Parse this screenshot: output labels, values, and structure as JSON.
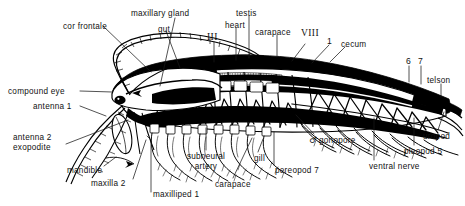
{
  "figure": {
    "width": 465,
    "height": 206,
    "background": "#ffffff",
    "ink": "#000000"
  },
  "labels": [
    {
      "id": "cor-frontale",
      "text": "cor  frontale",
      "x": 63,
      "y": 22,
      "align": "left"
    },
    {
      "id": "maxillary-gland",
      "text": "maxillary  gland",
      "x": 131,
      "y": 9,
      "align": "left"
    },
    {
      "id": "gut",
      "text": "gut",
      "x": 158,
      "y": 25,
      "align": "left"
    },
    {
      "id": "roman-three",
      "text": "III",
      "x": 208,
      "y": 35,
      "align": "left"
    },
    {
      "id": "heart",
      "text": "heart",
      "x": 225,
      "y": 21,
      "align": "left"
    },
    {
      "id": "testis",
      "text": "testis",
      "x": 236,
      "y": 9,
      "align": "left"
    },
    {
      "id": "carapace-top",
      "text": "carapace",
      "x": 257,
      "y": 28,
      "align": "left"
    },
    {
      "id": "roman-eight",
      "text": "VIII",
      "x": 303,
      "y": 31,
      "align": "left"
    },
    {
      "id": "segment-one",
      "text": "1",
      "x": 329,
      "y": 38,
      "align": "left"
    },
    {
      "id": "cecum",
      "text": "cecum",
      "x": 341,
      "y": 40,
      "align": "left"
    },
    {
      "id": "pleomere-six",
      "text": "6",
      "x": 407,
      "y": 59,
      "align": "left"
    },
    {
      "id": "pleomere-seven",
      "text": "7",
      "x": 419,
      "y": 59,
      "align": "left"
    },
    {
      "id": "telson",
      "text": "telson",
      "x": 428,
      "y": 77,
      "align": "left"
    },
    {
      "id": "compound-eye",
      "text": "compound  eye",
      "x": 8,
      "y": 88,
      "align": "left"
    },
    {
      "id": "antenna-1",
      "text": "antenna  1",
      "x": 33,
      "y": 103,
      "align": "left"
    },
    {
      "id": "antenna-2-exopodite",
      "text": "antenna  2\nexopodite",
      "x": 13,
      "y": 134,
      "align": "left"
    },
    {
      "id": "mandible",
      "text": "mandible",
      "x": 68,
      "y": 167,
      "align": "left"
    },
    {
      "id": "maxilla-2",
      "text": "maxilla  2",
      "x": 92,
      "y": 180,
      "align": "left"
    },
    {
      "id": "maxilliped-1",
      "text": "maxilliped  1",
      "x": 153,
      "y": 192,
      "align": "left"
    },
    {
      "id": "subneural-artery",
      "text": "subneural\nartery",
      "x": 189,
      "y": 153,
      "align": "center"
    },
    {
      "id": "carapace-bottom",
      "text": "carapace",
      "x": 215,
      "y": 181,
      "align": "left"
    },
    {
      "id": "gill",
      "text": "gill",
      "x": 255,
      "y": 155,
      "align": "left"
    },
    {
      "id": "pereopod-7",
      "text": "pereopod  7",
      "x": 276,
      "y": 167,
      "align": "left"
    },
    {
      "id": "gonopore",
      "text": "gonopore",
      "x": 318,
      "y": 137,
      "align": "left",
      "prefix": "♂"
    },
    {
      "id": "ventral-nerve",
      "text": "ventral  nerve",
      "x": 370,
      "y": 163,
      "align": "left"
    },
    {
      "id": "pleopod-5",
      "text": "pleopod  5",
      "x": 405,
      "y": 148,
      "align": "left"
    },
    {
      "id": "uropod",
      "text": "uropod",
      "x": 424,
      "y": 133,
      "align": "left"
    }
  ],
  "structures": {
    "body_regions": [
      "head",
      "thorax",
      "carapace",
      "pleon",
      "telson"
    ],
    "appendage_series": [
      "antenna 1",
      "antenna 2 exopodite",
      "mandible",
      "maxilla 2",
      "maxilliped 1",
      "pereopod 7",
      "pleopod 5",
      "uropod"
    ],
    "internal_organs": [
      "cor frontale",
      "maxillary gland",
      "gut",
      "heart",
      "testis",
      "cecum",
      "subneural artery",
      "ventral nerve",
      "gonopore",
      "gill"
    ],
    "segment_marks": [
      "III",
      "VIII",
      "1",
      "6",
      "7"
    ]
  },
  "leader_lines": [
    {
      "id": "leader-cor-frontale",
      "x1": 103,
      "y1": 26,
      "x2": 151,
      "y2": 72
    },
    {
      "id": "leader-maxillary-gland",
      "x1": 175,
      "y1": 18,
      "x2": 160,
      "y2": 86
    },
    {
      "id": "leader-gut",
      "x1": 166,
      "y1": 31,
      "x2": 180,
      "y2": 68
    },
    {
      "id": "leader-roman-three",
      "x1": 214,
      "y1": 42,
      "x2": 214,
      "y2": 62
    },
    {
      "id": "leader-heart",
      "x1": 236,
      "y1": 28,
      "x2": 236,
      "y2": 60
    },
    {
      "id": "leader-testis",
      "x1": 249,
      "y1": 16,
      "x2": 249,
      "y2": 58
    },
    {
      "id": "leader-carapace-top",
      "x1": 277,
      "y1": 35,
      "x2": 277,
      "y2": 57
    },
    {
      "id": "leader-roman-eight",
      "x1": 305,
      "y1": 44,
      "x2": 292,
      "y2": 61
    },
    {
      "id": "leader-segment-one",
      "x1": 329,
      "y1": 45,
      "x2": 312,
      "y2": 63
    },
    {
      "id": "leader-cecum",
      "x1": 345,
      "y1": 47,
      "x2": 330,
      "y2": 62
    },
    {
      "id": "leader-six",
      "x1": 409,
      "y1": 66,
      "x2": 409,
      "y2": 82
    },
    {
      "id": "leader-seven",
      "x1": 421,
      "y1": 66,
      "x2": 421,
      "y2": 84
    },
    {
      "id": "leader-telson",
      "x1": 441,
      "y1": 84,
      "x2": 441,
      "y2": 97
    },
    {
      "id": "leader-compound-eye",
      "x1": 80,
      "y1": 91,
      "x2": 112,
      "y2": 91
    },
    {
      "id": "leader-antenna-1",
      "x1": 80,
      "y1": 106,
      "x2": 106,
      "y2": 116
    },
    {
      "id": "leader-antenna-2",
      "x1": 66,
      "y1": 144,
      "x2": 128,
      "y2": 120
    },
    {
      "id": "leader-mandible",
      "x1": 104,
      "y1": 166,
      "x2": 116,
      "y2": 157
    },
    {
      "id": "leader-maxilla-2",
      "x1": 133,
      "y1": 179,
      "x2": 146,
      "y2": 140
    },
    {
      "id": "leader-maxilliped-1",
      "x1": 151,
      "y1": 193,
      "x2": 151,
      "y2": 138
    },
    {
      "id": "leader-subneural",
      "x1": 206,
      "y1": 150,
      "x2": 206,
      "y2": 128
    },
    {
      "id": "leader-carapace-bottom",
      "x1": 233,
      "y1": 178,
      "x2": 248,
      "y2": 140
    },
    {
      "id": "leader-gill",
      "x1": 257,
      "y1": 153,
      "x2": 262,
      "y2": 139
    },
    {
      "id": "leader-pereopod-7",
      "x1": 274,
      "y1": 165,
      "x2": 274,
      "y2": 134
    },
    {
      "id": "leader-gonopore",
      "x1": 315,
      "y1": 135,
      "x2": 296,
      "y2": 116
    },
    {
      "id": "leader-ventral-nerve",
      "x1": 374,
      "y1": 160,
      "x2": 374,
      "y2": 120
    },
    {
      "id": "leader-pleopod-5",
      "x1": 414,
      "y1": 145,
      "x2": 414,
      "y2": 120
    },
    {
      "id": "leader-uropod",
      "x1": 438,
      "y1": 130,
      "x2": 443,
      "y2": 110
    }
  ]
}
